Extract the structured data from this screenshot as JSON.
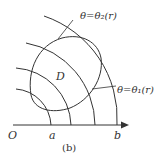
{
  "figure": {
    "caption": "(b)",
    "origin_label": "O",
    "axis_labels": {
      "a": "a",
      "b": "b"
    },
    "region_label": "D",
    "curve_labels": {
      "upper": "θ=θ₂(r)",
      "lower": "θ=θ₁(r)"
    },
    "colors": {
      "stroke": "#333333",
      "background": "#ffffff"
    }
  }
}
